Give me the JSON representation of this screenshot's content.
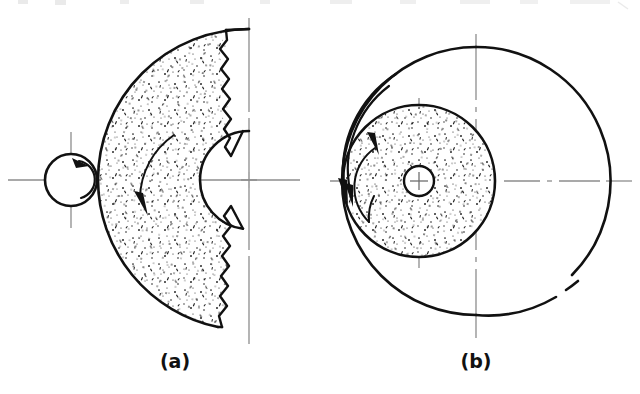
{
  "figure": {
    "kind": "engineering-line-drawing",
    "background_color": "#ffffff",
    "ink_color": "#111111",
    "centerline_color": "#8a8a8a",
    "stipple_color": "#1a1a1a",
    "width": 640,
    "height": 394,
    "top_cutoff_row_present": true,
    "top_cutoff_text": ""
  },
  "captions": {
    "a": "(a)",
    "b": "(b)"
  },
  "panels": [
    {
      "id": "a",
      "label": "(a)",
      "label_x": 175,
      "label_y": 368,
      "description": "external pinion meshing with internal ring-gear segment, stippled annular sector with break line",
      "centerlines": {
        "horizontal_y": 180,
        "vertical_x": 249,
        "pinion_cross_x": 71,
        "pinion_cross_y": 180
      },
      "pinion": {
        "name": "small-circle",
        "cx": 71,
        "cy": 180,
        "r": 26,
        "stroke_width": 2.4,
        "rotation_arrow": "clockwise"
      },
      "ring_sector": {
        "name": "stippled-annulus-sector",
        "cx": 249,
        "cy": 180,
        "outer_r": 151,
        "inner_r": 49,
        "break_line_x": 222,
        "fill": "stipple",
        "stroke_width": 2.4
      },
      "motion_arrow": {
        "name": "ring-direction-arrow",
        "direction": "down-right",
        "tip_x": 146,
        "tip_y": 212
      }
    },
    {
      "id": "b",
      "label": "(b)",
      "label_x": 476,
      "label_y": 368,
      "description": "stippled disc with central hole, offset inside a larger circle; two curved motion arrows at left",
      "centerlines": {
        "horizontal_y": 181,
        "outer_vertical_x": 476,
        "disc_vertical_x": 419,
        "dash_dot": true
      },
      "outer_circle": {
        "name": "outer-circle",
        "cx": 476,
        "cy": 181,
        "r": 134,
        "stroke_width": 2.4,
        "gap_arc": "lower-right"
      },
      "stippled_disc": {
        "name": "stippled-disc",
        "cx": 419,
        "cy": 181,
        "r": 76,
        "stroke_width": 2.4,
        "fill": "stipple"
      },
      "center_hole": {
        "name": "center-hole",
        "cx": 419,
        "cy": 181,
        "r": 15,
        "stroke_width": 2.2
      },
      "motion_arrows": [
        {
          "name": "outer-sweep-arrow",
          "direction": "down",
          "tip_x": 345,
          "tip_y": 200
        },
        {
          "name": "inner-sweep-arrow",
          "direction": "down",
          "tip_x": 368,
          "tip_y": 218
        }
      ]
    }
  ]
}
